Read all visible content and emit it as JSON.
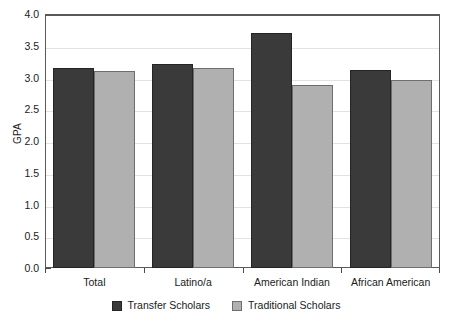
{
  "chart_data": {
    "type": "bar",
    "title": "",
    "xlabel": "",
    "ylabel": "GPA",
    "ylim": [
      0.0,
      4.0
    ],
    "ytick_step": 0.5,
    "ytick_labels": [
      "0.0",
      "0.5",
      "1.0",
      "1.5",
      "2.0",
      "2.5",
      "3.0",
      "3.5",
      "4.0"
    ],
    "grid": true,
    "legend_position": "bottom-center",
    "categories": [
      "Total",
      "Latino/a",
      "American Indian",
      "African American"
    ],
    "series": [
      {
        "name": "Transfer Scholars",
        "color": "#3a3a3a",
        "values": [
          3.15,
          3.22,
          3.7,
          3.12
        ]
      },
      {
        "name": "Traditional Scholars",
        "color": "#b0b0b0",
        "values": [
          3.11,
          3.15,
          2.89,
          2.96
        ]
      }
    ]
  },
  "axes": {
    "y_title": "GPA"
  }
}
